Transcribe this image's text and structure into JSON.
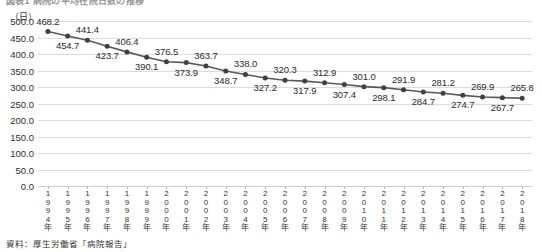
{
  "figure": {
    "title": "図表1  病院の平均在院日数の推移",
    "unit_label": "（日）",
    "source": "資料：厚生労働省「病院報告」"
  },
  "chart_data": {
    "type": "line",
    "title": "図表1  病院の平均在院日数の推移",
    "xlabel": "",
    "ylabel": "（日）",
    "ylim": [
      0,
      500
    ],
    "ytick_step": 50,
    "grid": true,
    "legend": "none",
    "yticks": [
      "500.0",
      "450.0",
      "400.0",
      "350.0",
      "300.0",
      "250.0",
      "200.0",
      "150.0",
      "100.0",
      "50.0",
      "0.0"
    ],
    "categories": [
      "1994年",
      "1995年",
      "1996年",
      "1997年",
      "1998年",
      "1999年",
      "2000年",
      "2001年",
      "2002年",
      "2003年",
      "2004年",
      "2005年",
      "2006年",
      "2007年",
      "2008年",
      "2009年",
      "2010年",
      "2011年",
      "2012年",
      "2013年",
      "2014年",
      "2015年",
      "2016年",
      "2017年",
      "2018年"
    ],
    "values": [
      468.2,
      454.7,
      441.4,
      423.7,
      406.4,
      390.1,
      376.5,
      373.9,
      363.7,
      348.7,
      338.0,
      327.2,
      320.3,
      317.9,
      312.9,
      307.4,
      301.0,
      298.1,
      291.9,
      284.7,
      281.2,
      274.7,
      269.9,
      267.7,
      265.8
    ],
    "value_labels": [
      "468.2",
      "454.7",
      "441.4",
      "423.7",
      "406.4",
      "390.1",
      "376.5",
      "373.9",
      "363.7",
      "348.7",
      "338.0",
      "327.2",
      "320.3",
      "317.9",
      "312.9",
      "307.4",
      "301.0",
      "298.1",
      "291.9",
      "284.7",
      "281.2",
      "274.7",
      "269.9",
      "267.7",
      "265.8"
    ],
    "label_positions": [
      "above",
      "below",
      "above",
      "below",
      "above",
      "below",
      "above",
      "below",
      "above",
      "below",
      "above",
      "below",
      "above",
      "below",
      "above",
      "below",
      "above",
      "below",
      "above",
      "below",
      "above",
      "below",
      "above",
      "below",
      "above"
    ],
    "colors": {
      "line": "#595959",
      "marker": "#404040",
      "grid": "#dcdcdc",
      "text": "#2b2b2b"
    }
  }
}
